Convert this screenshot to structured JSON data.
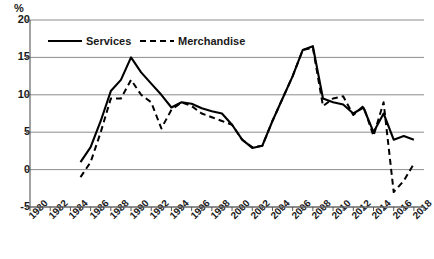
{
  "chart_data": {
    "type": "line",
    "title": "",
    "xlabel": "",
    "ylabel": "%",
    "ylim": [
      -5,
      20
    ],
    "ytick_step": 5,
    "yticks": [
      20,
      15,
      10,
      5,
      0,
      -5
    ],
    "xlim": [
      1980,
      2019
    ],
    "xtick_step": 2,
    "grid": true,
    "grid_axis": "y",
    "legend_position": "top-left-inside",
    "xticks": [
      "1980",
      "1982",
      "1984",
      "1986",
      "1988",
      "1990",
      "1992",
      "1994",
      "1996",
      "1998",
      "2000",
      "2002",
      "2004",
      "2006",
      "2008",
      "2010",
      "2012",
      "2014",
      "2016",
      "2018"
    ],
    "x": [
      1985,
      1986,
      1987,
      1988,
      1989,
      1990,
      1991,
      1992,
      1993,
      1994,
      1995,
      1996,
      1997,
      1998,
      1999,
      2000,
      2001,
      2002,
      2003,
      2004,
      2005,
      2006,
      2007,
      2008,
      2009,
      2010,
      2011,
      2012,
      2013,
      2014,
      2015,
      2016,
      2017,
      2018
    ],
    "series": [
      {
        "name": "Services",
        "style": "solid",
        "color": "#000000",
        "values": [
          1.0,
          3.0,
          6.5,
          10.5,
          12.0,
          15.0,
          13.0,
          11.5,
          10.0,
          8.3,
          9.0,
          8.8,
          8.2,
          7.8,
          7.5,
          6.0,
          4.0,
          2.9,
          3.2,
          6.5,
          9.5,
          12.5,
          16.0,
          16.5,
          9.5,
          9.0,
          8.7,
          7.5,
          8.3,
          5.0,
          7.5,
          4.0,
          4.5,
          4.0
        ]
      },
      {
        "name": "Merchandise",
        "style": "dashed",
        "color": "#000000",
        "values": [
          -1.0,
          1.0,
          5.0,
          9.5,
          9.5,
          12.0,
          10.0,
          9.0,
          5.5,
          8.0,
          9.0,
          8.5,
          7.5,
          7.0,
          6.5,
          6.0,
          4.0,
          3.0,
          3.2,
          6.5,
          9.5,
          12.5,
          16.0,
          16.3,
          8.5,
          9.5,
          9.8,
          7.3,
          8.5,
          4.5,
          9.0,
          -3.0,
          -1.5,
          0.8
        ]
      }
    ],
    "legend": [
      {
        "label": "Services",
        "style": "solid"
      },
      {
        "label": "Merchandise",
        "style": "dashed"
      }
    ]
  }
}
